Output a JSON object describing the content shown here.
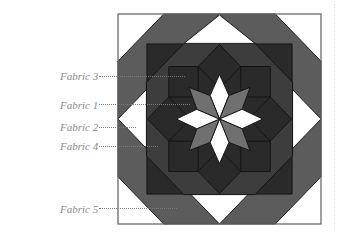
{
  "diagram": {
    "type": "quilt-block",
    "title": "",
    "fabrics": {
      "fabric1": "#707070",
      "fabric2": "#ffffff",
      "fabric3": "#2a2a2a",
      "fabric4": "#3d3d3d",
      "fabric5": "#5c5c5c"
    },
    "outline_color": "#111111",
    "frame_color": "#6a6a6a"
  },
  "labels": [
    {
      "id": "fabric3",
      "text": "Fabric 3"
    },
    {
      "id": "fabric1",
      "text": "Fabric 1"
    },
    {
      "id": "fabric2",
      "text": "Fabric 2"
    },
    {
      "id": "fabric4",
      "text": "Fabric 4"
    },
    {
      "id": "fabric5",
      "text": "Fabric 5"
    }
  ]
}
